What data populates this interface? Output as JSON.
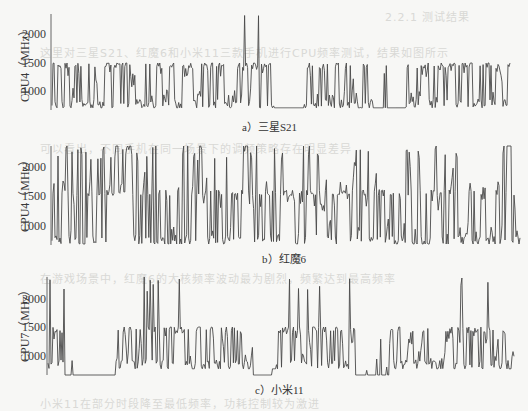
{
  "figure": {
    "background": "#f7f7f5",
    "line_color": "#4a4a4a",
    "axis_color": "#666666"
  },
  "chart_data": [
    {
      "type": "line",
      "caption": "a）三星S21",
      "ylabel": "CPU4（MHz）",
      "xlabel": "",
      "yticks": [
        "2000",
        "1500",
        "1000"
      ],
      "ylim": [
        700,
        2400
      ],
      "grid": false,
      "legend": null,
      "description": "Dense noisy frequency trace mostly oscillating 700–1500 MHz; spikes to ~1700–2400 near start; two idle stretches at ~700 MHz (around 48–55% and 70–76% of x-range) with sparse spikes",
      "series": [
        {
          "name": "CPU4 frequency",
          "gen": {
            "seed": 11,
            "n": 460,
            "base": [
              700,
              1500
            ],
            "cap": 1500,
            "spike_prob": 0.01,
            "spike_max": 2400,
            "idle": [
              [
                0.48,
                0.55
              ],
              [
                0.7,
                0.77
              ]
            ],
            "idle_val": 700
          },
          "sample_values": [
            700,
            1500,
            1000,
            1400,
            700,
            1300,
            1500,
            1100,
            2400,
            1200,
            900,
            1500,
            700,
            700,
            1300,
            1500,
            900,
            1400
          ]
        }
      ]
    },
    {
      "type": "line",
      "caption": "b）红魔6",
      "ylabel": "CPU4（MHz）",
      "xlabel": "",
      "yticks": [
        "2000",
        "1500",
        "1000"
      ],
      "ylim": [
        700,
        2400
      ],
      "grid": false,
      "legend": null,
      "description": "Dense noisy trace centered ~1000–1400 MHz with frequent spikes up to ~2400 MHz and dips to ~700 MHz throughout",
      "series": [
        {
          "name": "CPU4 frequency",
          "gen": {
            "seed": 23,
            "n": 470,
            "base": [
              700,
              1600
            ],
            "cap": 2400,
            "spike_prob": 0.09,
            "spike_max": 2400,
            "idle": [],
            "idle_val": 700
          },
          "sample_values": [
            2400,
            700,
            1300,
            2400,
            900,
            1500,
            2100,
            1200,
            700,
            2400,
            1400,
            1000,
            1800,
            700,
            2400,
            1300,
            1100,
            2000
          ]
        }
      ]
    },
    {
      "type": "line",
      "caption": "c）小米11",
      "ylabel": "CPU7（MHz）",
      "xlabel": "",
      "yticks": [
        "2000",
        "1500",
        "1000"
      ],
      "ylim": [
        650,
        2400
      ],
      "grid": false,
      "legend": null,
      "description": "Trace mostly 800–1500 MHz with plateau at 1500 MHz, frequent spikes to ~2400 MHz; idle stretches at ~650 MHz near start (~3–14%), around 44–48%, and 66–73% of x-range",
      "series": [
        {
          "name": "CPU7 frequency",
          "gen": {
            "seed": 37,
            "n": 466,
            "base": [
              780,
              1500
            ],
            "cap": 1500,
            "spike_prob": 0.05,
            "spike_max": 2400,
            "idle": [
              [
                0.035,
                0.145
              ],
              [
                0.44,
                0.48
              ],
              [
                0.66,
                0.735
              ]
            ],
            "idle_val": 650
          },
          "sample_values": [
            2400,
            1800,
            650,
            650,
            1500,
            2400,
            800,
            1500,
            1200,
            2400,
            900,
            1500,
            650,
            650,
            2400,
            1500,
            800,
            1500
          ]
        }
      ]
    }
  ],
  "ghost_text": [
    "2.2.1  测试结果",
    "这里对三星S21、红魔6和小米11三款手机进行CPU频率测试，结果如图所示",
    "可以看出，不同手机在同一场景下的调频策略存在明显差异",
    "在游戏场景中，红魔6的大核频率波动最为剧烈，频繁达到最高频率",
    "小米11在部分时段降至最低频率，功耗控制较为激进"
  ]
}
